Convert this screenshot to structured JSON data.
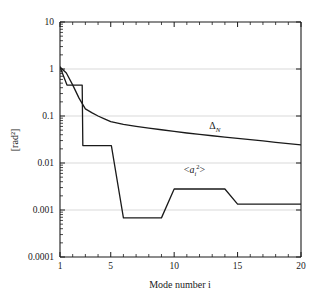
{
  "chart_data": {
    "type": "line",
    "title": "",
    "xlabel": "Mode number i",
    "ylabel": "[rad²]",
    "xlim": [
      1,
      20
    ],
    "ylim": [
      0.0001,
      10
    ],
    "yscale": "log",
    "xscale": "linear",
    "grid": "horizontal-decades",
    "legend": "inline-annotations",
    "x_ticks": [
      1,
      5,
      10,
      15,
      20
    ],
    "x_tick_labels": [
      "1",
      "5",
      "10",
      "15",
      "20"
    ],
    "y_ticks": [
      10,
      1,
      0.1,
      0.01,
      0.001,
      0.0001
    ],
    "y_tick_labels": [
      "10",
      "1",
      "0.1",
      "0.01",
      "0.001",
      "0.0001"
    ],
    "series": [
      {
        "name": "Δ_N",
        "label_text": "Δ",
        "label_sub": "N",
        "label_x": 13.2,
        "label_y": 0.052,
        "color": "#1a1a1a",
        "x": [
          1,
          1.5,
          2,
          2.5,
          3,
          3.5,
          4,
          4.5,
          5,
          6,
          7,
          8,
          9,
          10,
          11,
          12,
          13,
          14,
          15,
          16,
          17,
          18,
          19,
          20
        ],
        "values": [
          1.1,
          0.82,
          0.46,
          0.24,
          0.142,
          0.118,
          0.1,
          0.087,
          0.076,
          0.066,
          0.06,
          0.055,
          0.051,
          0.047,
          0.0435,
          0.0405,
          0.038,
          0.0355,
          0.0335,
          0.0315,
          0.0295,
          0.0275,
          0.0258,
          0.0242
        ]
      },
      {
        "name": "<a_i²>",
        "label_text": "<aᵢ²>",
        "label_x": 11.6,
        "label_y": 0.0062,
        "color": "#1a1a1a",
        "x": [
          1,
          1.55,
          1.6,
          2.75,
          2.8,
          5.0,
          5.05,
          6.0,
          9.0,
          10.0,
          14.0,
          15.0,
          20.0
        ],
        "values": [
          1.1,
          0.455,
          0.455,
          0.455,
          0.0235,
          0.0235,
          0.0235,
          0.00068,
          0.00068,
          0.0028,
          0.0028,
          0.00133,
          0.00133
        ]
      }
    ]
  },
  "axes": {
    "y_axis_label": "[rad²]",
    "x_axis_label": "Mode number i"
  }
}
